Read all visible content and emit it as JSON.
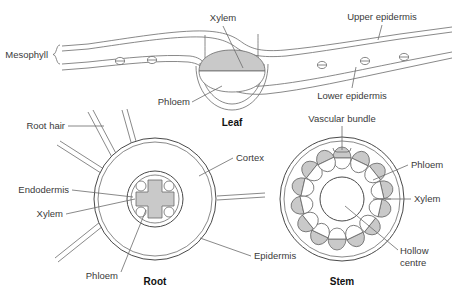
{
  "diagram": {
    "title_leaf": "Leaf",
    "title_root": "Root",
    "title_stem": "Stem",
    "colors": {
      "tissue_grey": "#c9c9c9",
      "outline": "#4a4a4a",
      "leader": "#6b6b6b",
      "text": "#3a3a3a"
    }
  },
  "leaf": {
    "labels": {
      "mesophyll": "Mesophyll",
      "xylem": "Xylem",
      "phloem": "Phloem",
      "upper_epidermis": "Upper epidermis",
      "lower_epidermis": "Lower epidermis"
    },
    "stomata_count": 5
  },
  "root": {
    "labels": {
      "root_hair": "Root hair",
      "endodermis": "Endodermis",
      "xylem": "Xylem",
      "phloem": "Phloem",
      "cortex": "Cortex",
      "epidermis": "Epidermis"
    },
    "root_hair_count": 5,
    "phloem_cell_count": 4
  },
  "stem": {
    "labels": {
      "vascular_bundle": "Vascular bundle",
      "phloem": "Phloem",
      "xylem": "Xylem",
      "hollow_centre_line1": "Hollow",
      "hollow_centre_line2": "centre"
    },
    "bundle_count": 14
  }
}
